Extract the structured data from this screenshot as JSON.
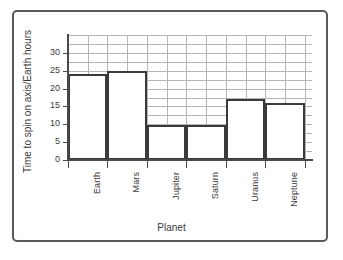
{
  "chart_data": {
    "type": "bar",
    "title": "",
    "xlabel": "Planet",
    "ylabel": "Time to spin on axis/Earth hours",
    "categories": [
      "Earth",
      "Mars",
      "Jupiter",
      "Saturn",
      "Uranus",
      "Neptune"
    ],
    "values": [
      24,
      25,
      9.9,
      9.9,
      17,
      16
    ],
    "ylim": [
      0,
      35
    ],
    "yticks": [
      0,
      5,
      10,
      15,
      20,
      25,
      30
    ],
    "ytick_labels": [
      "0",
      "5",
      "10",
      "15",
      "20",
      "25",
      "30"
    ],
    "grid": true,
    "grid_minor_y_step": 2.5,
    "grid_minor_x_per_category": 2,
    "legend": "none",
    "bar_style": "outline",
    "colors": {
      "bar_edge": "#3a3a3a",
      "bar_fill": "#ffffff",
      "grid": "#b4b4b4",
      "axis": "#4a4a4a",
      "text": "#3b3b3b",
      "frame": "#5a5a5a",
      "background": "#ffffff"
    }
  }
}
